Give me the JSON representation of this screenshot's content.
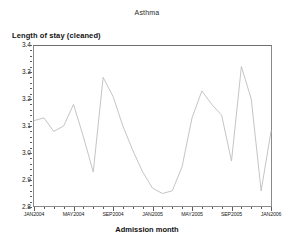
{
  "chart_data": {
    "type": "line",
    "title": "Asthma",
    "ylabel": "Length of stay (cleaned)",
    "xlabel": "Admission month",
    "ylim": [
      2.8,
      3.4
    ],
    "yticks": [
      "3.4",
      "3.3",
      "3.2",
      "3.1",
      "3.0",
      "2.9",
      "2.8"
    ],
    "ytick_values": [
      3.4,
      3.3,
      3.2,
      3.1,
      3.0,
      2.9,
      2.8
    ],
    "xticks": [
      "JAN2004",
      "MAY2004",
      "SEP2004",
      "JAN2005",
      "MAY2005",
      "SEP2005",
      "JAN2006"
    ],
    "xtick_values": [
      0,
      4,
      8,
      12,
      16,
      20,
      24
    ],
    "grid": false,
    "legend": false,
    "line_color": "#b8b8b8",
    "x": [
      "JAN2004",
      "FEB2004",
      "MAR2004",
      "APR2004",
      "MAY2004",
      "JUN2004",
      "JUL2004",
      "AUG2004",
      "SEP2004",
      "OCT2004",
      "NOV2004",
      "DEC2004",
      "JAN2005",
      "FEB2005",
      "MAR2005",
      "APR2005",
      "MAY2005",
      "JUN2005",
      "JUL2005",
      "AUG2005",
      "SEP2005",
      "OCT2005",
      "NOV2005",
      "DEC2005",
      "JAN2006"
    ],
    "values": [
      3.12,
      3.13,
      3.08,
      3.1,
      3.18,
      3.06,
      2.93,
      3.28,
      3.21,
      3.1,
      3.01,
      2.93,
      2.87,
      2.85,
      2.86,
      2.95,
      3.13,
      3.23,
      3.18,
      3.14,
      2.97,
      3.32,
      3.2,
      2.86,
      3.08
    ],
    "series": [
      {
        "name": "Length of stay (cleaned)",
        "values": [
          3.12,
          3.13,
          3.08,
          3.1,
          3.18,
          3.06,
          2.93,
          3.28,
          3.21,
          3.1,
          3.01,
          2.93,
          2.87,
          2.85,
          2.86,
          2.95,
          3.13,
          3.23,
          3.18,
          3.14,
          2.97,
          3.32,
          3.2,
          2.86,
          3.08
        ]
      }
    ]
  }
}
